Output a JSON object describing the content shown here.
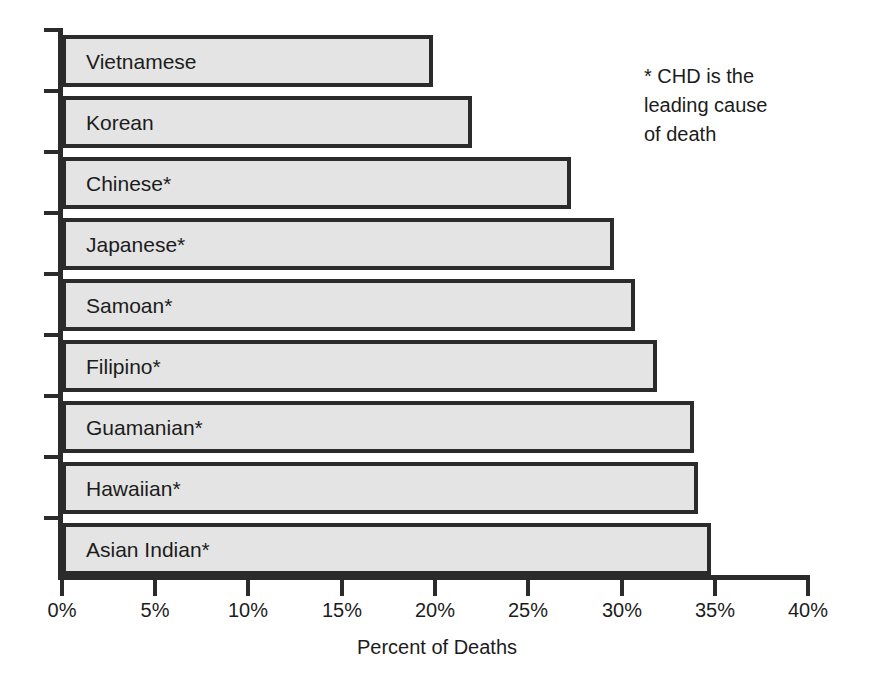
{
  "chart_data": {
    "type": "bar",
    "orientation": "horizontal",
    "title": "",
    "xlabel": "Percent of Deaths",
    "ylabel": "",
    "xlim": [
      0,
      40
    ],
    "grid": false,
    "legend": null,
    "xtick_labels": [
      "0%",
      "5%",
      "10%",
      "15%",
      "20%",
      "25%",
      "30%",
      "35%",
      "40%"
    ],
    "xtick_values": [
      0,
      5,
      10,
      15,
      20,
      25,
      30,
      35,
      40
    ],
    "categories": [
      "Vietnamese",
      "Korean",
      "Chinese*",
      "Japanese*",
      "Samoan*",
      "Filipino*",
      "Guamanian*",
      "Hawaiian*",
      "Asian Indian*"
    ],
    "values": [
      19.8,
      21.9,
      27.2,
      29.5,
      30.6,
      31.8,
      33.8,
      34.0,
      34.7
    ],
    "annotations": [
      "* CHD is the leading cause of death"
    ],
    "bar_fill_color": "#e4e4e4",
    "bar_border_color": "#2b2b2b",
    "axis_color": "#2b2b2b"
  },
  "note": {
    "line1": "* CHD is the",
    "line2": "leading cause",
    "line3": "of death"
  },
  "axis": {
    "x_title": "Percent of Deaths"
  }
}
